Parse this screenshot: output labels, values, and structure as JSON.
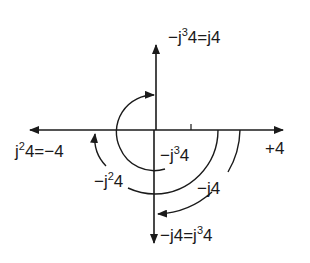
{
  "diagram": {
    "title": "",
    "labels": {
      "top": {
        "pre": "−j",
        "sup": "3",
        "post": "4=j4"
      },
      "left": {
        "pre": "j",
        "sup": "2",
        "post": "4=−4"
      },
      "right": "+4",
      "inner_arc": {
        "pre": "−j",
        "sup": "3",
        "post": "4"
      },
      "middle_arc": {
        "pre": "−j",
        "sup": "2",
        "post": "4"
      },
      "outer_arc": "−j4",
      "bottom": {
        "pre": "−j4=j",
        "sup": "3",
        "post": "4"
      }
    },
    "colors": {
      "ink": "#1a1a1a",
      "background": "#ffffff"
    }
  }
}
